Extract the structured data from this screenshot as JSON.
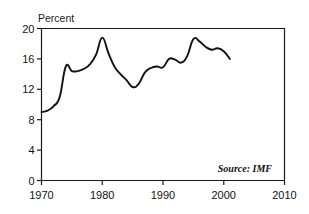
{
  "chart_data": {
    "type": "line",
    "title": "",
    "subtitle": "",
    "ylabel": "Percent",
    "xlabel": "",
    "xlim": [
      1970,
      2010
    ],
    "ylim": [
      0,
      20
    ],
    "grid": false,
    "legend": null,
    "y_ticks": [
      0,
      4,
      8,
      12,
      16,
      20
    ],
    "y_tick_labels": [
      "0",
      "4",
      "8",
      "12",
      "16",
      "20"
    ],
    "x_ticks": [
      1970,
      1980,
      1990,
      2000,
      2010
    ],
    "x_tick_labels": [
      "1970",
      "1980",
      "1990",
      "2000",
      "2010"
    ],
    "annotations": [
      {
        "text": "Source: IMF",
        "position": "bottom-right-inside-plot"
      }
    ],
    "series": [
      {
        "name": "Percent",
        "x": [
          1970,
          1971,
          1972,
          1973,
          1974,
          1975,
          1976,
          1977,
          1978,
          1979,
          1980,
          1981,
          1982,
          1983,
          1984,
          1985,
          1986,
          1987,
          1988,
          1989,
          1990,
          1991,
          1992,
          1993,
          1994,
          1995,
          1996,
          1997,
          1998,
          1999,
          2000,
          2001
        ],
        "values": [
          9.0,
          9.2,
          9.8,
          11.0,
          15.0,
          14.4,
          14.4,
          14.7,
          15.3,
          16.6,
          18.8,
          16.8,
          15.0,
          14.0,
          13.2,
          12.3,
          12.7,
          14.2,
          14.8,
          15.0,
          14.9,
          16.0,
          15.9,
          15.5,
          16.4,
          18.6,
          18.3,
          17.6,
          17.2,
          17.4,
          17.0,
          16.0
        ]
      }
    ]
  },
  "labels": {
    "y_axis_caption": "Percent",
    "source_note": "Source: IMF"
  }
}
